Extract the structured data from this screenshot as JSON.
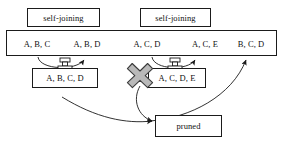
{
  "diagram": {
    "colors": {
      "stroke": "#1b1b1b",
      "box_fill": "#ffffff",
      "x_fill": "#b9b9b9",
      "x_stroke": "#3a3a3a",
      "background": "#ffffff"
    },
    "labels": {
      "self_joining_left": "self-joining",
      "self_joining_right": "self-joining",
      "pruned": "pruned"
    },
    "itemset_bar": {
      "name": "candidate-itemset-bar",
      "cells": [
        {
          "id": "abc",
          "label": "A, B, C",
          "left": 12,
          "width": 48
        },
        {
          "id": "abd",
          "label": "A, B, D",
          "left": 62,
          "width": 48
        },
        {
          "id": "acd",
          "label": "A, C, D",
          "left": 122,
          "width": 48
        },
        {
          "id": "ace",
          "label": "A, C, E",
          "left": 180,
          "width": 48
        },
        {
          "id": "bcd",
          "label": "B, C, D",
          "left": 226,
          "width": 48
        }
      ]
    },
    "generated": [
      {
        "id": "abcd",
        "label": "A, B, C, D"
      },
      {
        "id": "acde",
        "label": "A, C, D, E"
      }
    ],
    "x_mark": {
      "name": "pruned-cross-mark",
      "symbol": "X"
    }
  }
}
